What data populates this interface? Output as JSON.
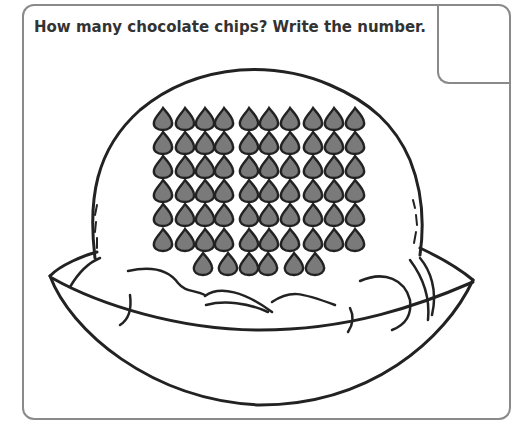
{
  "worksheet": {
    "question": "How many chocolate chips? Write the number.",
    "answer_value": ""
  },
  "illustration": {
    "subject": "ice-cream-scoop-in-bowl",
    "chip_rows": [
      10,
      10,
      10,
      10,
      10,
      10,
      6
    ],
    "chip_total": 66,
    "chip_color": "#7a7a7a",
    "outline_color": "#222222",
    "frame_color": "#8a8a8a"
  }
}
